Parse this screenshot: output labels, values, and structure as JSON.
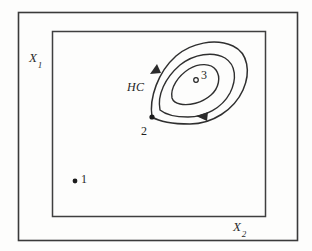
{
  "figure": {
    "type": "diagram",
    "axes": {
      "vertical": {
        "symbol": "X",
        "subscript": "1",
        "position": "upper-left, outside inner box"
      },
      "horizontal": {
        "symbol": "X",
        "subscript": "2",
        "position": "lower-right, outside inner box"
      }
    },
    "annotations": {
      "hc_label": "HC",
      "hc_meaning": "hill climbing path"
    },
    "points": [
      {
        "id": "point-1",
        "label": "1",
        "marker": "filled-dot",
        "x": 75,
        "y": 181,
        "label_x": 81,
        "label_y": 172
      },
      {
        "id": "point-2",
        "label": "2",
        "marker": "filled-dot",
        "x": 152,
        "y": 117,
        "label_x": 141,
        "label_y": 124
      },
      {
        "id": "point-3",
        "label": "3",
        "marker": "open-circle",
        "x": 196,
        "y": 80,
        "label_x": 201,
        "label_y": 68
      }
    ],
    "contours": [
      {
        "id": "contour-outer",
        "level": 1
      },
      {
        "id": "contour-middle",
        "level": 2
      },
      {
        "id": "contour-inner",
        "level": 3
      }
    ],
    "arrows": [
      {
        "id": "arrow-left",
        "direction": "up-right",
        "on": "contour-outer"
      },
      {
        "id": "arrow-right",
        "direction": "left",
        "on": "contour-outer"
      }
    ],
    "frames": [
      {
        "id": "outer-frame",
        "x": 18,
        "y": 12,
        "width": 279,
        "height": 228
      },
      {
        "id": "inner-frame",
        "x": 52,
        "y": 31,
        "width": 213,
        "height": 185
      }
    ],
    "colors": {
      "ink": "#2b2b2b",
      "line": "#3a3a3a",
      "background": "#fdfdfc"
    }
  }
}
